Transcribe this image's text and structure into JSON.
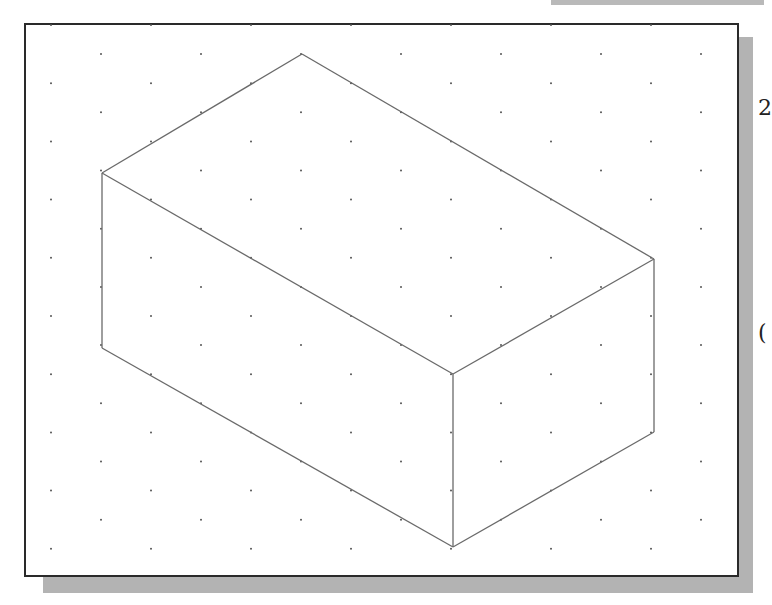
{
  "figure": {
    "type": "isometric-box-drawing",
    "grid": {
      "style": "isometric dot grid",
      "dot_color": "#555555",
      "column_spacing": 100,
      "row_spacing": 29.1,
      "origin_x": 51,
      "origin_y": 25,
      "rows": 19
    },
    "box": {
      "stroke_color": "#6a6a6a",
      "vertices": {
        "top": [
          302,
          54
        ],
        "left_top": [
          102,
          173
        ],
        "right_top": [
          654,
          259
        ],
        "front_top": [
          453,
          374
        ],
        "left_bottom": [
          102,
          348
        ],
        "front_bottom": [
          453,
          547
        ],
        "right_bottom": [
          654,
          432
        ]
      }
    }
  },
  "edge_glyphs": [
    {
      "text": "2",
      "y": 97
    },
    {
      "text": "(",
      "y": 322
    }
  ]
}
